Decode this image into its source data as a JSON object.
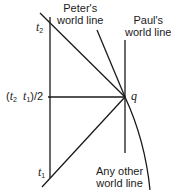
{
  "diagram": {
    "colors": {
      "line": "#1a1a1a",
      "background": "#ffffff"
    },
    "labels": {
      "peter": [
        "Peter's",
        "world line"
      ],
      "paul": [
        "Paul's",
        "world line"
      ],
      "other": [
        "Any other",
        "world line"
      ],
      "t2": {
        "var": "t",
        "sub": "2"
      },
      "t1": {
        "var": "t",
        "sub": "1"
      },
      "midpoint": {
        "open": "(",
        "t2var": "t",
        "t2sub": "2",
        "t1var": "t",
        "t1sub": "1",
        "close": ")/2"
      },
      "event": "q"
    }
  }
}
